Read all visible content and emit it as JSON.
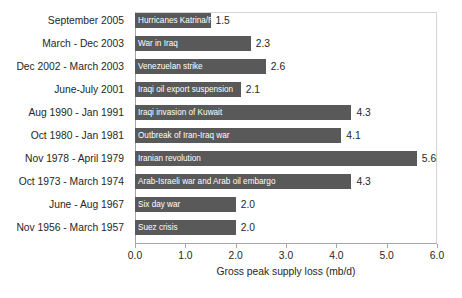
{
  "chart_data": {
    "type": "bar",
    "orientation": "horizontal",
    "title": "",
    "xlabel": "Gross peak supply loss (mb/d)",
    "ylabel": "",
    "xlim": [
      0.0,
      6.0
    ],
    "xticks": [
      "0.0",
      "1.0",
      "2.0",
      "3.0",
      "4.0",
      "5.0",
      "6.0"
    ],
    "grid": false,
    "legend": false,
    "bar_color": "#595959",
    "categories": [
      "September 2005",
      "March - Dec 2003",
      "Dec 2002 - March 2003",
      "June-July 2001",
      "Aug 1990 - Jan 1991",
      "Oct 1980 - Jan 1981",
      "Nov 1978 - April 1979",
      "Oct 1973 - March 1974",
      "June - Aug 1967",
      "Nov 1956 - March 1957"
    ],
    "values": [
      1.5,
      2.3,
      2.6,
      2.1,
      4.3,
      4.1,
      5.6,
      4.3,
      2.0,
      2.0
    ],
    "value_labels": [
      "1.5",
      "2.3",
      "2.6",
      "2.1",
      "4.3",
      "4.1",
      "5.6",
      "4.3",
      "2.0",
      "2.0"
    ],
    "bar_labels": [
      "Hurricanes Katrina/Rita",
      "War in Iraq",
      "Venezuelan strike",
      "Iraqi oil export suspension",
      "Iraqi invasion of Kuwait",
      "Outbreak of Iran-Iraq war",
      "Iranian revolution",
      "Arab-Israeli war and Arab oil embargo",
      "Six day war",
      "Suez crisis"
    ]
  }
}
